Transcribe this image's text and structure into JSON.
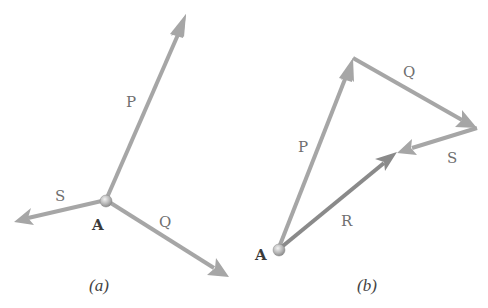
{
  "colors": {
    "vector_light": "#a6a6a6",
    "vector_dark": "#8a8a8a",
    "label": "#6f6f6f",
    "point_label": "#3a3a3a",
    "caption": "#444444",
    "background": "#ffffff"
  },
  "panel_a": {
    "caption": "(a)",
    "point_label": "A",
    "vectors": [
      {
        "name": "P",
        "label": "P"
      },
      {
        "name": "Q",
        "label": "Q"
      },
      {
        "name": "S",
        "label": "S"
      }
    ]
  },
  "panel_b": {
    "caption": "(b)",
    "point_label": "A",
    "vectors": [
      {
        "name": "P",
        "label": "P"
      },
      {
        "name": "Q",
        "label": "Q"
      },
      {
        "name": "S",
        "label": "S"
      },
      {
        "name": "R",
        "label": "R"
      }
    ]
  }
}
